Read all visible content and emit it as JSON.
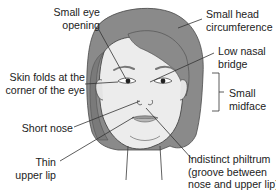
{
  "diagram": {
    "colors": {
      "hair": "#8a8a8a",
      "hair_shadow": "#6e6e6e",
      "skin": "#ececec",
      "outline": "#3a3a3a",
      "leader_line": "#333333",
      "text": "#222222",
      "lip": "#a8a8a8"
    },
    "labels": [
      {
        "id": "small-eye-opening",
        "lines": [
          "Small eye",
          "opening"
        ]
      },
      {
        "id": "skin-folds",
        "lines": [
          "Skin folds at the",
          "corner of the eye"
        ]
      },
      {
        "id": "short-nose",
        "lines": [
          "Short nose"
        ]
      },
      {
        "id": "thin-upper-lip",
        "lines": [
          "Thin",
          "upper lip"
        ]
      },
      {
        "id": "small-head",
        "lines": [
          "Small head",
          "circumference"
        ]
      },
      {
        "id": "low-nasal-bridge",
        "lines": [
          "Low nasal",
          "bridge"
        ]
      },
      {
        "id": "small-midface",
        "lines": [
          "Small",
          "midface"
        ]
      },
      {
        "id": "indistinct-philtrum",
        "lines": [
          "Indistinct philtrum",
          "(groove between",
          "nose and upper lip)"
        ]
      }
    ]
  }
}
